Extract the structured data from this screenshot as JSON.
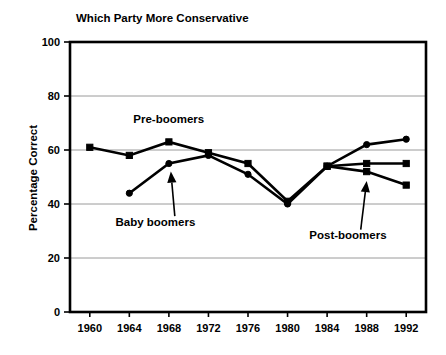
{
  "chart_data": {
    "type": "line",
    "title": "Which Party More Conservative",
    "xlabel": "",
    "ylabel": "Percentage Correct",
    "x": [
      1960,
      1964,
      1968,
      1972,
      1976,
      1980,
      1984,
      1988,
      1992
    ],
    "categories": [
      "1960",
      "1964",
      "1968",
      "1972",
      "1976",
      "1980",
      "1984",
      "1988",
      "1992"
    ],
    "xlim": [
      1958,
      1994
    ],
    "ylim": [
      0,
      100
    ],
    "yticks": [
      0,
      20,
      40,
      60,
      80,
      100
    ],
    "ytick_labels": [
      "0",
      "20",
      "40",
      "60",
      "80",
      "100"
    ],
    "grid": "horizontal",
    "legend": "inline-annotations",
    "series": [
      {
        "name": "Pre-boomers",
        "marker": "square",
        "values": [
          61,
          58,
          63,
          59,
          55,
          41,
          54,
          55,
          55
        ]
      },
      {
        "name": "Baby boomers",
        "marker": "circle",
        "values": [
          null,
          44,
          55,
          58,
          51,
          40,
          54,
          62,
          64
        ]
      },
      {
        "name": "Post-boomers",
        "marker": "square",
        "values": [
          null,
          null,
          null,
          null,
          null,
          null,
          54,
          52,
          47
        ]
      }
    ],
    "annotations": [
      {
        "text": "Pre-boomers",
        "x": 1964.4,
        "y": 70
      },
      {
        "text": "Baby boomers",
        "x": 1962.6,
        "y": 32
      },
      {
        "text": "Post-boomers",
        "x": 1982.2,
        "y": 27
      }
    ]
  },
  "colors": {
    "ink": "#000000",
    "grid": "#9a9a9a",
    "background": "#ffffff"
  }
}
